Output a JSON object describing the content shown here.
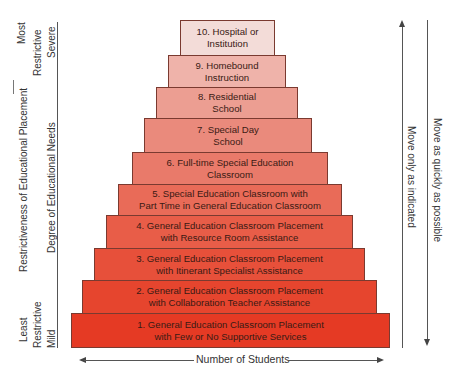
{
  "tiers": [
    {
      "label": "10. Hospital or\nInstitution",
      "color": "#f3dcd8"
    },
    {
      "label": "9. Homebound\nInstruction",
      "color": "#efb3aa"
    },
    {
      "label": "8. Residential\nSchool",
      "color": "#ec9e92"
    },
    {
      "label": "7. Special Day\nSchool",
      "color": "#ea8a7c"
    },
    {
      "label": "6. Full-time Special Education\nClassroom",
      "color": "#e97a6a"
    },
    {
      "label": "5. Special Education Classroom with\nPart Time in General Education Classroom",
      "color": "#e96b58"
    },
    {
      "label": "4. General Education Classroom Placement\nwith Resource Room Assistance",
      "color": "#e85d48"
    },
    {
      "label": "3. General Education Classroom Placement\nwith Itinerant Specialist Assistance",
      "color": "#e7503a"
    },
    {
      "label": "2. General Education Classroom Placement\nwith Collaboration Teacher Assistance",
      "color": "#e6452e"
    },
    {
      "label": "1. General Education Classroom Placement\nwith Few or No Supportive Services",
      "color": "#e53a24"
    }
  ],
  "left_axis": {
    "outer_label": "Restrictiveness of Educational Placement",
    "inner_label": "Degree of Educational Needs",
    "top_outer": "Most",
    "top_mid": "Restrictive",
    "top_inner": "Severe",
    "bottom_outer": "Least",
    "bottom_mid": "Restrictive",
    "bottom_inner": "Mild"
  },
  "right_axis": {
    "up_label": "Move only as indicated",
    "down_label": "Move as quickly as possible"
  },
  "bottom_axis": {
    "label": "Number of Students"
  }
}
